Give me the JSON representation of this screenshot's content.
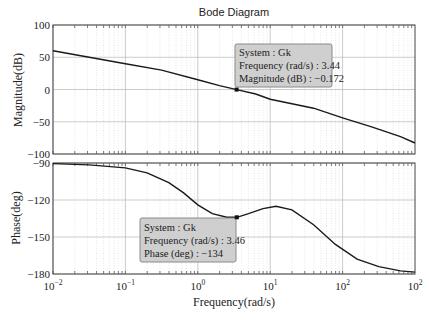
{
  "chart_data": {
    "type": "line",
    "title": "Bode Diagram",
    "xlabel": "Frequency(rad/s)",
    "xscale": "log",
    "xlim": [
      0.01,
      100
    ],
    "x_tick_labels": [
      "10^-2",
      "10^-1",
      "10^0",
      "10^1",
      "10^2",
      "10^2"
    ],
    "grid": true,
    "panels": [
      {
        "name": "magnitude",
        "ylabel": "Magnitude(dB)",
        "ylim": [
          -100,
          100
        ],
        "y_ticks": [
          100,
          50,
          0,
          -50,
          -100
        ],
        "series": [
          {
            "name": "Gk",
            "log10_x": [
              -2,
              -1.5,
              -1,
              -0.5,
              0,
              0.3,
              0.537,
              0.8,
              1,
              1.3,
              1.6,
              2,
              2.4,
              2.8,
              3
            ],
            "values": [
              60,
              50,
              40,
              30,
              15,
              6,
              -0.172,
              -7,
              -15,
              -22,
              -29,
              -44,
              -58,
              -73,
              -83
            ]
          }
        ],
        "datatip": {
          "system_line": "System : Gk",
          "freq_line": "Frequency (rad/s) : 3.44",
          "value_line": "Magnitude (dB) : −0.172",
          "frequency": 3.44,
          "value": -0.172
        }
      },
      {
        "name": "phase",
        "ylabel": "Phase(deg)",
        "ylim": [
          -180,
          -90
        ],
        "y_ticks": [
          -90,
          -120,
          -150,
          -180
        ],
        "series": [
          {
            "name": "Gk",
            "log10_x": [
              -2,
              -1.5,
              -1,
              -0.7,
              -0.4,
              -0.2,
              0,
              0.2,
              0.4,
              0.54,
              0.7,
              0.9,
              1.08,
              1.3,
              1.6,
              1.9,
              2.2,
              2.5,
              2.8,
              3
            ],
            "values": [
              -90.5,
              -91.5,
              -94,
              -98,
              -106,
              -114,
              -124,
              -131,
              -134,
              -134,
              -131,
              -127,
              -125,
              -128,
              -140,
              -156,
              -168,
              -174,
              -177.5,
              -178.5
            ]
          }
        ],
        "datatip": {
          "system_line": "System : Gk",
          "freq_line": "Frequency (rad/s) : 3.46",
          "value_line": "Phase (deg) : −134",
          "frequency": 3.46,
          "value": -134
        }
      }
    ]
  },
  "colors": {
    "curve": "#1a1a1a",
    "grid": "#c8c8c8",
    "axis": "#444444",
    "datatip_bg": "#cfcfcf",
    "datatip_border": "#8a8a8a"
  }
}
